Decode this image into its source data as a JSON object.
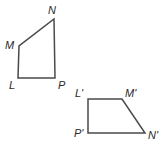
{
  "figure": {
    "background_color": "#ffffff",
    "stroke_color": "#4a4a4a",
    "label_color": "#2b2b2b",
    "stroke_width": 1.5
  },
  "shapes": [
    {
      "name": "quadrilateral-LMNP",
      "closed": true,
      "vertices": [
        {
          "label": "L",
          "x": 18,
          "y": 78
        },
        {
          "label": "M",
          "x": 19,
          "y": 46
        },
        {
          "label": "N",
          "x": 54,
          "y": 19
        },
        {
          "label": "P",
          "x": 55,
          "y": 78
        }
      ],
      "path": "M 18 78 L 19 46 L 54 19 L 55 78 Z"
    },
    {
      "name": "quadrilateral-L-prime-M-prime-N-prime-P-prime",
      "closed": true,
      "vertices": [
        {
          "label": "L'",
          "x": 88,
          "y": 99
        },
        {
          "label": "M'",
          "x": 122,
          "y": 99
        },
        {
          "label": "N'",
          "x": 145,
          "y": 133
        },
        {
          "label": "P'",
          "x": 88,
          "y": 133
        }
      ],
      "path": "M 88 99 L 122 99 L 145 133 L 88 133 Z"
    }
  ],
  "labels": [
    {
      "key": "label_N",
      "text": "N",
      "x": 48,
      "y": 5,
      "shape": "quadrilateral-LMNP"
    },
    {
      "key": "label_M",
      "text": "M",
      "x": 5,
      "y": 40,
      "shape": "quadrilateral-LMNP"
    },
    {
      "key": "label_L",
      "text": "L",
      "x": 9,
      "y": 80,
      "shape": "quadrilateral-LMNP"
    },
    {
      "key": "label_P",
      "text": "P",
      "x": 58,
      "y": 80,
      "shape": "quadrilateral-LMNP"
    },
    {
      "key": "label_Lp",
      "text": "L'",
      "x": 75,
      "y": 88,
      "shape": "quadrilateral-L-prime-M-prime-N-prime-P-prime"
    },
    {
      "key": "label_Mp",
      "text": "M'",
      "x": 125,
      "y": 88,
      "shape": "quadrilateral-L-prime-M-prime-N-prime-P-prime"
    },
    {
      "key": "label_Pp",
      "text": "P'",
      "x": 74,
      "y": 128,
      "shape": "quadrilateral-L-prime-M-prime-N-prime-P-prime"
    },
    {
      "key": "label_Np",
      "text": "N'",
      "x": 148,
      "y": 130,
      "shape": "quadrilateral-L-prime-M-prime-N-prime-P-prime"
    }
  ],
  "text": {
    "label_N": "N",
    "label_M": "M",
    "label_L": "L",
    "label_P": "P",
    "label_Lp": "L'",
    "label_Mp": "M'",
    "label_Pp": "P'",
    "label_Np": "N'"
  }
}
